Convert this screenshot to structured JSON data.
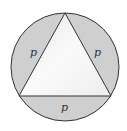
{
  "diagram": {
    "colors": {
      "segment_fill": "#cfcfcf",
      "triangle_fill": "#f2f2f2",
      "stroke": "#333333",
      "background": "#ffffff"
    },
    "labels": {
      "left_segment": "p",
      "right_segment": "p",
      "bottom_segment": "p"
    }
  }
}
